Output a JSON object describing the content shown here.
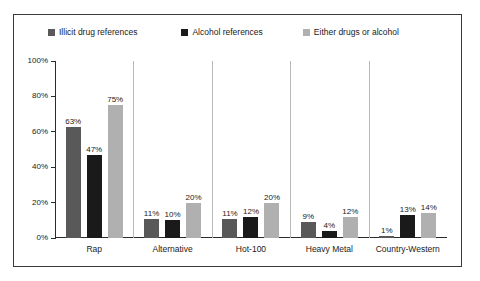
{
  "chart_data": {
    "type": "bar",
    "title": "",
    "xlabel": "",
    "ylabel": "",
    "ylim": [
      0,
      100
    ],
    "yticks": [
      "0%",
      "20%",
      "40%",
      "60%",
      "80%",
      "100%"
    ],
    "grid": false,
    "legend_position": "top",
    "categories": [
      "Rap",
      "Alternative",
      "Hot-100",
      "Heavy Metal",
      "Country-Western"
    ],
    "series": [
      {
        "name": "Illicit drug references",
        "color": "#595959",
        "values": [
          63,
          11,
          11,
          9,
          1
        ],
        "labels": [
          "63%",
          "11%",
          "11%",
          "9%",
          "1%"
        ]
      },
      {
        "name": "Alcohol references",
        "color": "#1a1a1a",
        "values": [
          47,
          10,
          12,
          4,
          13
        ],
        "labels": [
          "47%",
          "10%",
          "12%",
          "4%",
          "13%"
        ]
      },
      {
        "name": "Either drugs or alcohol",
        "color": "#b0b0b0",
        "values": [
          75,
          20,
          20,
          12,
          14
        ],
        "labels": [
          "75%",
          "20%",
          "20%",
          "12%",
          "14%"
        ]
      }
    ]
  }
}
